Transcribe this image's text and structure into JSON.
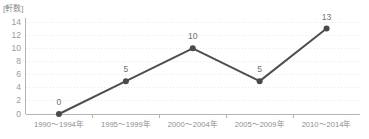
{
  "chart_data": {
    "type": "line",
    "title": "",
    "subtitle": "",
    "xlabel": "",
    "ylabel": "[軒数]",
    "unit_label": "[軒数]",
    "categories": [
      "1990〜1994年",
      "1995〜1999年",
      "2000〜2004年",
      "2005〜2009年",
      "2010〜2014年"
    ],
    "values": [
      0,
      5,
      10,
      5,
      13
    ],
    "point_labels": [
      "0",
      "5",
      "10",
      "5",
      "13"
    ],
    "ylim": [
      0,
      14
    ],
    "ytick_labels": [
      "14",
      "12",
      "10",
      "8",
      "6",
      "4",
      "2",
      "0"
    ],
    "ytick_values": [
      14,
      12,
      10,
      8,
      6,
      4,
      2,
      0
    ],
    "ytick_step": 2,
    "grid": true,
    "grid_style": "dotted",
    "legend": false,
    "legend_position": "none",
    "colors": {
      "line": "#4f4f4f",
      "marker": "#4a4a4a",
      "grid": "#e9e9e9",
      "axis": "#b4b4b4",
      "ytick_text": "#9a9a9a",
      "xtick_text": "#8e8e8e",
      "point_label_text": "#6f6f6f",
      "unit_label_text": "#888888",
      "background": "#ffffff"
    }
  }
}
